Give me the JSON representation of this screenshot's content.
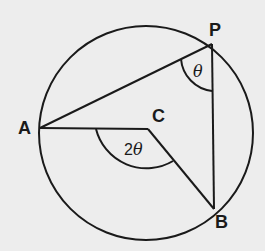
{
  "diagram": {
    "type": "circle-geometry",
    "circle": {
      "center": [
        146,
        133
      ],
      "radius": 107
    },
    "points": {
      "A": {
        "label": "A",
        "pos": [
          40,
          128
        ]
      },
      "P": {
        "label": "P",
        "pos": [
          212,
          44
        ]
      },
      "B": {
        "label": "B",
        "pos": [
          214,
          209
        ]
      },
      "C": {
        "label": "C",
        "pos": [
          148,
          129
        ]
      }
    },
    "segments": [
      {
        "from": "A",
        "to": "P"
      },
      {
        "from": "P",
        "to": "B"
      },
      {
        "from": "A",
        "to": "C"
      },
      {
        "from": "C",
        "to": "B"
      }
    ],
    "angles": {
      "inscribed": {
        "vertex": "P",
        "label": "θ"
      },
      "central": {
        "vertex": "C",
        "label": "2θ",
        "label_num": "2",
        "label_greek": "θ"
      }
    },
    "colors": {
      "stroke": "#1a1a1a",
      "background": "#ededed"
    }
  }
}
